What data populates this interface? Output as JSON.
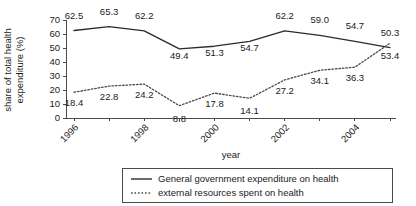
{
  "chart_data": {
    "type": "line",
    "title": "",
    "xlabel": "year",
    "ylabel": "share of total health expenditure (%)",
    "ylabel_line1": "share of total health",
    "ylabel_line2": "expenditure (%)",
    "grid": false,
    "legend_position": "bottom",
    "ylim": [
      0,
      70
    ],
    "yticks": [
      0,
      10,
      20,
      30,
      40,
      50,
      60,
      70
    ],
    "ytick_labels": [
      "0",
      "10",
      "20",
      "30",
      "40",
      "50",
      "60",
      "70"
    ],
    "x": [
      1996,
      1997,
      1998,
      1999,
      2000,
      2001,
      2002,
      2003,
      2004,
      2005
    ],
    "categories": [
      "1996",
      "1997",
      "1998",
      "1999",
      "2000",
      "2001",
      "2002",
      "2003",
      "2004",
      "2005"
    ],
    "xtick_labels": [
      "1996",
      "1998",
      "2000",
      "2002",
      "2004"
    ],
    "xtick_values": [
      1996,
      1998,
      2000,
      2002,
      2004
    ],
    "series": [
      {
        "name": "General government expenditure on health",
        "style": "solid",
        "color": "#2b2b2b",
        "values": [
          62.5,
          65.3,
          62.2,
          49.4,
          51.3,
          54.7,
          62.2,
          59.0,
          54.7,
          50.3
        ],
        "labels": [
          "62.5",
          "65.3",
          "62.2",
          "49.4",
          "51.3",
          "54.7",
          "62.2",
          "59.0",
          "54.7",
          "50.3"
        ]
      },
      {
        "name": "external resources spent on health",
        "style": "dotted",
        "color": "#4a4a4a",
        "values": [
          18.4,
          22.8,
          24.2,
          8.8,
          17.8,
          14.1,
          27.2,
          34.1,
          36.3,
          53.4
        ],
        "labels": [
          "18.4",
          "22.8",
          "24.2",
          "8.8",
          "17.8",
          "14.1",
          "27.2",
          "34.1",
          "36.3",
          "53.4"
        ]
      }
    ]
  },
  "legend": {
    "items": [
      {
        "label": "General government expenditure on health",
        "style": "solid"
      },
      {
        "label": "external resources spent on health",
        "style": "dotted"
      }
    ]
  }
}
